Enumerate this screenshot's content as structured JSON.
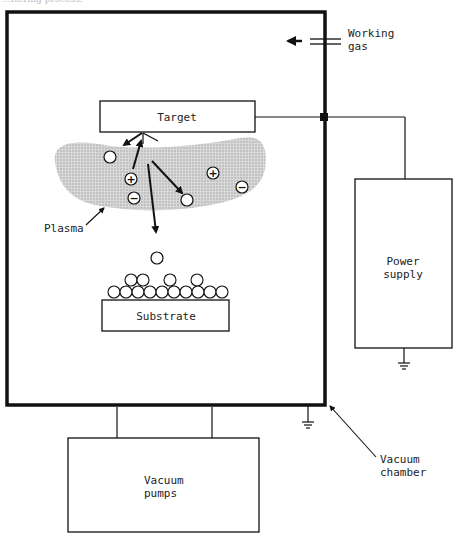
{
  "caption_fragment": "...ttering process.",
  "labels": {
    "target": "Target",
    "substrate": "Substrate",
    "plasma": "Plasma",
    "working_gas_line1": "Working",
    "working_gas_line2": "gas",
    "power_supply_line1": "Power",
    "power_supply_line2": "supply",
    "vacuum_pumps_line1": "Vacuum",
    "vacuum_pumps_line2": "pumps",
    "vacuum_chamber_line1": "Vacuum",
    "vacuum_chamber_line2": "chamber"
  },
  "ions": {
    "positive_symbol": "+",
    "negative_symbol": "−"
  },
  "colors": {
    "line": "#111111",
    "plasma_fill": "#c8c8c8",
    "text": "#222222",
    "background": "#ffffff"
  }
}
